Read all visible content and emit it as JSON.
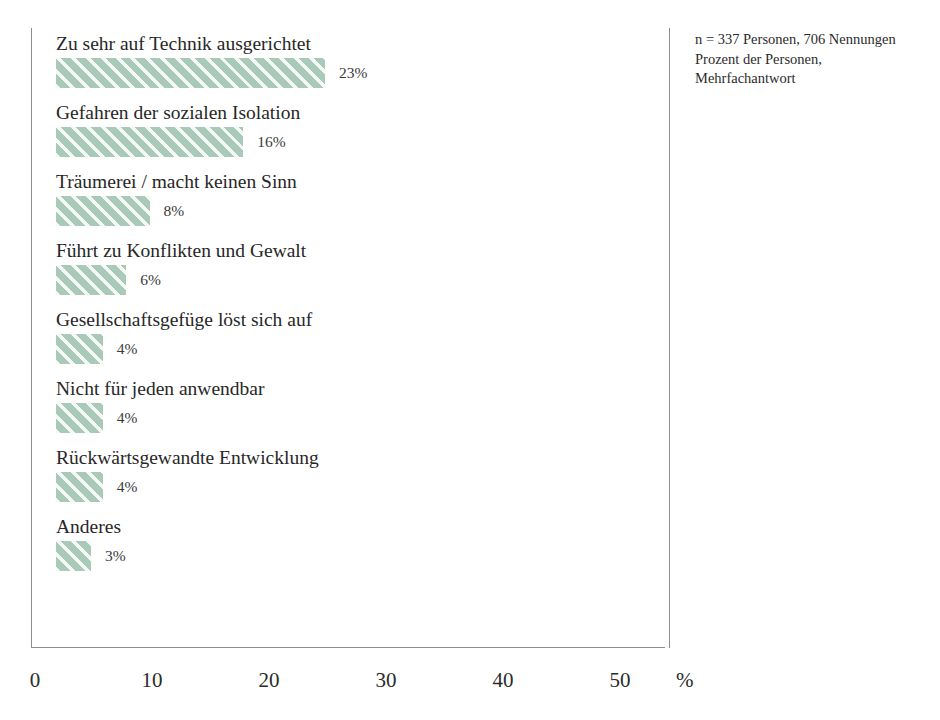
{
  "chart_data": {
    "type": "bar",
    "orientation": "horizontal",
    "title": "",
    "subtitle": "",
    "xlabel": "%",
    "ylabel": "",
    "xlim": [
      0,
      50
    ],
    "x_ticks": [
      0,
      10,
      20,
      30,
      40,
      50
    ],
    "x_tick_labels": [
      "0",
      "10",
      "20",
      "30",
      "40",
      "50"
    ],
    "grid": false,
    "legend": null,
    "bar_color": "#a9c9b9",
    "bar_pattern": "diagonal-hatch",
    "categories": [
      "Zu sehr auf Technik ausgerichtet",
      "Gefahren der sozialen Isolation",
      "Träumerei / macht keinen Sinn",
      "Führt zu Konflikten und Gewalt",
      "Gesellschaftsgefüge löst sich auf",
      "Nicht für jeden anwendbar",
      "Rückwärtsgewandte Entwicklung",
      "Anderes"
    ],
    "values": [
      23,
      16,
      8,
      6,
      4,
      4,
      4,
      3
    ],
    "value_labels": [
      "23%",
      "16%",
      "8%",
      "6%",
      "4%",
      "4%",
      "4%",
      "3%"
    ],
    "bars": [
      {
        "label": "Zu sehr auf Technik ausgerichtet",
        "value": 23,
        "value_label": "23%"
      },
      {
        "label": "Gefahren der sozialen Isolation",
        "value": 16,
        "value_label": "16%"
      },
      {
        "label": "Träumerei / macht keinen Sinn",
        "value": 8,
        "value_label": "8%"
      },
      {
        "label": "Führt zu Konflikten und Gewalt",
        "value": 6,
        "value_label": "6%"
      },
      {
        "label": "Gesellschaftsgefüge löst sich auf",
        "value": 4,
        "value_label": "4%"
      },
      {
        "label": "Nicht für jeden anwendbar",
        "value": 4,
        "value_label": "4%"
      },
      {
        "label": "Rückwärtsgewandte Entwicklung",
        "value": 4,
        "value_label": "4%"
      },
      {
        "label": "Anderes",
        "value": 3,
        "value_label": "3%"
      }
    ]
  },
  "note": {
    "lines": [
      "n = 337 Personen, 706 Nennungen",
      "Prozent der Personen,",
      "Mehrfachantwort"
    ]
  },
  "axis": {
    "unit": "%"
  }
}
